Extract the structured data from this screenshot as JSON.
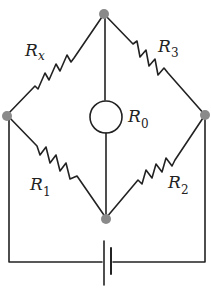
{
  "diagram": {
    "type": "Wheatstone bridge circuit",
    "colors": {
      "wire": "#222222",
      "node": "#8a8a8a",
      "background": "#ffffff"
    },
    "labels": {
      "rx": {
        "main": "R",
        "sub": "x"
      },
      "r3": {
        "main": "R",
        "sub": "3"
      },
      "r0": {
        "main": "R",
        "sub": "0"
      },
      "r1": {
        "main": "R",
        "sub": "1"
      },
      "r2": {
        "main": "R",
        "sub": "2"
      }
    },
    "components": [
      {
        "id": "Rx",
        "kind": "resistor",
        "between": [
          "left-node",
          "top-node"
        ]
      },
      {
        "id": "R3",
        "kind": "resistor",
        "between": [
          "top-node",
          "right-node"
        ]
      },
      {
        "id": "R1",
        "kind": "resistor",
        "between": [
          "left-node",
          "bottom-node"
        ]
      },
      {
        "id": "R2",
        "kind": "resistor",
        "between": [
          "bottom-node",
          "right-node"
        ]
      },
      {
        "id": "R0",
        "kind": "galvanometer (circle)",
        "between": [
          "top-node",
          "bottom-node"
        ]
      },
      {
        "id": "battery",
        "kind": "cell",
        "between": [
          "left-node",
          "right-node"
        ]
      }
    ],
    "nodes": [
      "top-node",
      "left-node",
      "right-node",
      "bottom-node"
    ]
  }
}
